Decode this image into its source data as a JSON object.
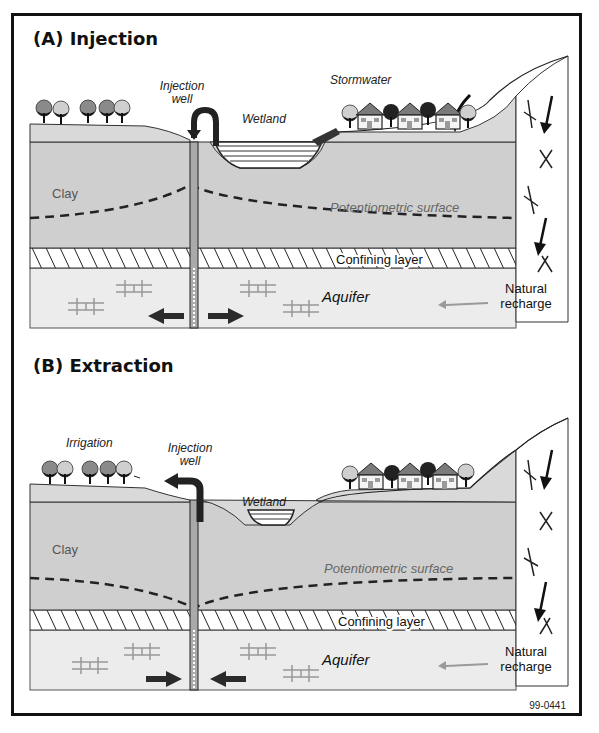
{
  "figure": {
    "id_label": "99-0441",
    "colors": {
      "clay": "#cfcfcf",
      "surface_soil": "#d9d9d9",
      "aquifer": "#ececec",
      "confining": "#ffffff",
      "line": "#222222",
      "arrow": "#2b2b2b",
      "natural_arrow": "#9a9a9a"
    }
  },
  "panels": [
    {
      "title": "(A) Injection",
      "labels": {
        "well": "Injection\nwell",
        "well_line1": "Injection",
        "well_line2": "well",
        "wetland": "Wetland",
        "stormwater": "Stormwater",
        "clay": "Clay",
        "potentiometric": "Potentiometric surface",
        "confining": "Confining layer",
        "aquifer": "Aquifer",
        "recharge_line1": "Natural",
        "recharge_line2": "recharge"
      },
      "flow_direction": "outward"
    },
    {
      "title": "(B) Extraction",
      "labels": {
        "irrigation": "Irrigation",
        "well_line1": "Injection",
        "well_line2": "well",
        "wetland": "Wetland",
        "clay": "Clay",
        "potentiometric": "Potentiometric surface",
        "confining": "Confining layer",
        "aquifer": "Aquifer",
        "recharge_line1": "Natural",
        "recharge_line2": "recharge"
      },
      "flow_direction": "inward"
    }
  ]
}
